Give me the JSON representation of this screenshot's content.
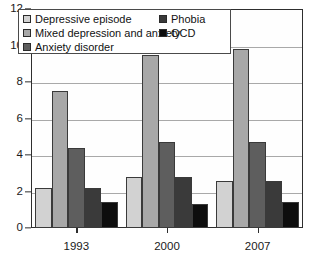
{
  "chart_data": {
    "type": "bar",
    "title": "",
    "subtitle": "",
    "xlabel": "",
    "ylabel": "",
    "categories": [
      "1993",
      "2000",
      "2007"
    ],
    "ylim": [
      0,
      12
    ],
    "yticks": [
      0,
      2,
      4,
      6,
      8,
      10,
      12
    ],
    "ytick_labels": [
      "0",
      "2",
      "4",
      "6",
      "8",
      "10",
      "12"
    ],
    "grid": true,
    "grid_axis": "y",
    "legend_position": "top-left",
    "series": [
      {
        "name": "Depressive episode",
        "color": "#d2d2d2",
        "values": [
          2.2,
          2.8,
          2.6
        ]
      },
      {
        "name": "Mixed depression and anxiety",
        "color": "#a8a8a8",
        "values": [
          7.5,
          9.5,
          9.8
        ]
      },
      {
        "name": "Anxiety disorder",
        "color": "#5e5e5e",
        "values": [
          4.4,
          4.7,
          4.7
        ]
      },
      {
        "name": "Phobia",
        "color": "#3a3a3a",
        "values": [
          2.2,
          2.8,
          2.6
        ]
      },
      {
        "name": "OCD",
        "color": "#0d0d0d",
        "values": [
          1.4,
          1.3,
          1.4
        ]
      }
    ]
  },
  "legend": {
    "left_column": [
      {
        "label": "Depressive episode",
        "color": "#d2d2d2"
      },
      {
        "label": "Mixed depression and anxiety",
        "color": "#a8a8a8"
      },
      {
        "label": "Anxiety disorder",
        "color": "#5e5e5e"
      }
    ],
    "right_column": [
      {
        "label": "Phobia",
        "color": "#3a3a3a"
      },
      {
        "label": "OCD",
        "color": "#0d0d0d"
      }
    ]
  },
  "axes": {
    "y_tick_labels": [
      "12",
      "10",
      "8",
      "6",
      "4",
      "2",
      "0"
    ],
    "x_tick_labels": [
      "1993",
      "2000",
      "2007"
    ]
  }
}
